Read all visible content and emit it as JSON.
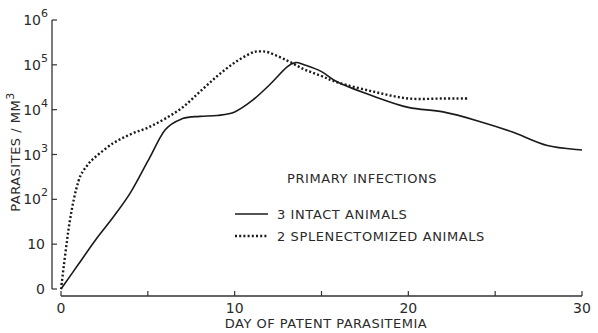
{
  "chart_data": {
    "type": "line",
    "title": "",
    "xlabel": "DAY OF PATENT PARASITEMIA",
    "ylabel": "PARASITES / MM3",
    "ylabel_parts": {
      "main": "PARASITES / MM",
      "sup": "3"
    },
    "xlim": [
      0,
      30
    ],
    "ylim_log10": [
      0,
      6
    ],
    "yscale": "log",
    "x_ticks": [
      0,
      5,
      10,
      15,
      20,
      25,
      30
    ],
    "x_tick_labels": [
      "0",
      "",
      "10",
      "",
      "20",
      "",
      "30"
    ],
    "y_ticks": [
      {
        "base": "0",
        "exp": ""
      },
      {
        "base": "10",
        "exp": ""
      },
      {
        "base": "10",
        "exp": "2"
      },
      {
        "base": "10",
        "exp": "3"
      },
      {
        "base": "10",
        "exp": "4"
      },
      {
        "base": "10",
        "exp": "5"
      },
      {
        "base": "10",
        "exp": "6"
      }
    ],
    "grid": false,
    "legend_title": "PRIMARY INFECTIONS",
    "legend_position": "center-right inside",
    "series": [
      {
        "name": "3 INTACT ANIMALS",
        "style": "solid",
        "x": [
          0,
          1,
          2,
          3,
          4,
          5,
          6,
          7,
          8,
          9,
          10,
          11,
          12,
          13,
          13.5,
          14,
          15,
          16,
          18,
          20,
          22,
          24,
          26,
          28,
          30
        ],
        "log10y": [
          0,
          0.55,
          1.1,
          1.6,
          2.15,
          2.85,
          3.55,
          3.8,
          3.85,
          3.87,
          3.95,
          4.2,
          4.55,
          4.95,
          5.05,
          5.0,
          4.85,
          4.6,
          4.3,
          4.05,
          3.95,
          3.75,
          3.5,
          3.2,
          3.1
        ]
      },
      {
        "name": "2 SPLENECTOMIZED ANIMALS",
        "style": "dotted",
        "x": [
          0,
          0.5,
          1,
          1.5,
          2,
          3,
          4,
          5,
          6,
          7,
          8,
          9,
          10,
          11,
          11.5,
          12,
          13,
          14,
          15,
          16,
          18,
          20,
          22,
          23.5
        ],
        "log10y": [
          0,
          1.5,
          2.4,
          2.75,
          2.95,
          3.25,
          3.45,
          3.6,
          3.8,
          4.05,
          4.4,
          4.75,
          5.05,
          5.27,
          5.3,
          5.27,
          5.1,
          4.9,
          4.75,
          4.6,
          4.4,
          4.25,
          4.25,
          4.25
        ]
      }
    ]
  }
}
